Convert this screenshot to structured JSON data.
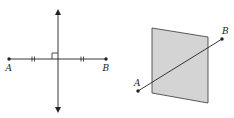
{
  "figures": [
    {
      "id": "perpendicular-bisector",
      "points": {
        "A": {
          "label": "A",
          "x": 9,
          "y": 59
        },
        "B": {
          "label": "B",
          "x": 106,
          "y": 59
        }
      },
      "segment": {
        "from": "A",
        "to": "B",
        "tick_marks": "double"
      },
      "bisector": {
        "x": 58,
        "y_top": 10,
        "y_bottom": 112,
        "arrows": "both",
        "right_angle_marker": true
      }
    },
    {
      "id": "perpendicular-plane",
      "points": {
        "A": {
          "label": "A",
          "x": 138,
          "y": 91
        },
        "B": {
          "label": "B",
          "x": 222,
          "y": 39
        }
      },
      "plane": {
        "corners": [
          [
            152,
            28
          ],
          [
            208,
            37
          ],
          [
            208,
            103
          ],
          [
            152,
            93
          ]
        ],
        "fill": "#d4d4d4"
      }
    }
  ],
  "labels": {
    "left_A": "A",
    "left_B": "B",
    "right_A": "A",
    "right_B": "B"
  },
  "colors": {
    "ink": "#222222",
    "plane_fill": "#d4d4d4"
  }
}
